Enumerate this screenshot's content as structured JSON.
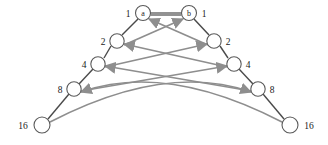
{
  "figure": {
    "type": "directed-graph-diagram",
    "background_color": "#ffffff",
    "node_fill": "#ffffff",
    "node_stroke": "#5a5a5a",
    "chain_edge_color": "#4a4a4a",
    "cross_edge_color": "#8e8e8e",
    "label_color": "#1a1a1a"
  },
  "nodes": {
    "root_left": {
      "inner_label": "a",
      "outer_label": "1",
      "cx": 143,
      "cy": 13,
      "r": 7.5
    },
    "root_right": {
      "inner_label": "b",
      "outer_label": "1",
      "cx": 189,
      "cy": 13,
      "r": 7.5
    },
    "left_chain": [
      {
        "outer_label": "2",
        "cx": 117,
        "cy": 41,
        "r": 7.2
      },
      {
        "outer_label": "4",
        "cx": 98,
        "cy": 64,
        "r": 7.2
      },
      {
        "outer_label": "8",
        "cx": 74,
        "cy": 89,
        "r": 7.2
      },
      {
        "outer_label": "16",
        "cx": 42,
        "cy": 125,
        "r": 8.0
      }
    ],
    "right_chain": [
      {
        "outer_label": "2",
        "cx": 214,
        "cy": 41,
        "r": 7.2
      },
      {
        "outer_label": "4",
        "cx": 234,
        "cy": 64,
        "r": 7.2
      },
      {
        "outer_label": "8",
        "cx": 258,
        "cy": 89,
        "r": 7.2
      },
      {
        "outer_label": "16",
        "cx": 290,
        "cy": 125,
        "r": 8.0
      }
    ]
  },
  "labels": {
    "left_outer": [
      "1",
      "2",
      "4",
      "8",
      "16"
    ],
    "right_outer": [
      "1",
      "2",
      "4",
      "8",
      "16"
    ],
    "root_names": [
      "a",
      "b"
    ]
  },
  "edges": {
    "top_link": {
      "from": "a",
      "to": "b",
      "style": "solid-dark"
    },
    "chain_left": [
      [
        "a",
        "2"
      ],
      [
        "2",
        "4"
      ],
      [
        "4",
        "8"
      ],
      [
        "8",
        "16"
      ]
    ],
    "chain_right": [
      [
        "b",
        "2"
      ],
      [
        "2",
        "4"
      ],
      [
        "4",
        "8"
      ],
      [
        "8",
        "16"
      ]
    ],
    "cross_pairs": [
      {
        "from": "left-2",
        "to": "right-b",
        "direction": "to-right"
      },
      {
        "from": "right-2",
        "to": "left-a",
        "direction": "to-left"
      },
      {
        "from": "left-4",
        "to": "right-2",
        "direction": "to-right"
      },
      {
        "from": "right-4",
        "to": "left-2",
        "direction": "to-left"
      },
      {
        "from": "left-8",
        "to": "right-4",
        "direction": "to-right"
      },
      {
        "from": "right-8",
        "to": "left-4",
        "direction": "to-left"
      },
      {
        "from": "left-16",
        "to": "right-8",
        "direction": "to-right"
      },
      {
        "from": "right-16",
        "to": "left-8",
        "direction": "to-left"
      }
    ]
  }
}
